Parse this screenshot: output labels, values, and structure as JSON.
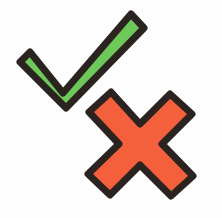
{
  "figure": {
    "background_color": "#fdfdfd",
    "width": 222,
    "height": 218
  },
  "marks": {
    "check": {
      "label": "Green check mark",
      "meaning": "correct",
      "fill_color": "#6ec95b",
      "outline_color": "#2a2320",
      "outline_width": 7,
      "position": "upper-left",
      "points": "30,52 63,93 131,14 144,28 66,108 20,62"
    },
    "cross": {
      "label": "Red cross mark",
      "meaning": "incorrect",
      "fill_color": "#f4603c",
      "outline_color": "#2a2320",
      "outline_width": 7,
      "position": "lower-right",
      "points": "111,92 140,124 170,94 192,114 162,144 193,176 171,196 140,165 110,195 88,174 119,144 89,112"
    }
  },
  "caption": {
    "text": "illegible",
    "color": "#b9c4dc",
    "visible": false
  }
}
